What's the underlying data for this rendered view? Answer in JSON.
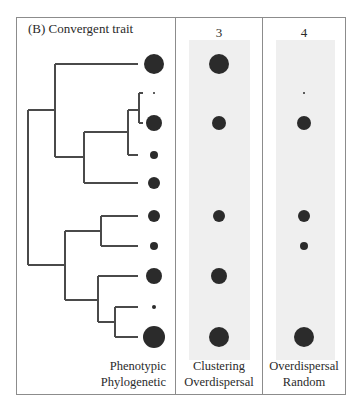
{
  "figure": {
    "panel_label": "(B)  Convergent trait",
    "columns": [
      {
        "id": "phylogeny",
        "label_line1": "Phenotypic",
        "label_line2": "Phylogenetic"
      },
      {
        "id": "3",
        "header": "3",
        "label_line1": "Clustering",
        "label_line2": "Overdispersal"
      },
      {
        "id": "4",
        "header": "4",
        "label_line1": "Overdispersal",
        "label_line2": "Random"
      }
    ],
    "colors": {
      "branch": "#4a4a4a",
      "dot": "#2b2b2b",
      "frame": "#8c8c8c",
      "shade": "#efefef"
    },
    "tips": [
      {
        "index": 1,
        "y": 64,
        "trait_r": 10,
        "col3_r": 10,
        "col4_r": 0
      },
      {
        "index": 2,
        "y": 93,
        "trait_r": 1,
        "col3_r": 0,
        "col4_r": 1
      },
      {
        "index": 3,
        "y": 123,
        "trait_r": 8,
        "col3_r": 7,
        "col4_r": 7
      },
      {
        "index": 4,
        "y": 155,
        "trait_r": 4,
        "col3_r": 0,
        "col4_r": 0
      },
      {
        "index": 5,
        "y": 183,
        "trait_r": 6,
        "col3_r": 0,
        "col4_r": 0
      },
      {
        "index": 6,
        "y": 216,
        "trait_r": 6,
        "col3_r": 6,
        "col4_r": 6
      },
      {
        "index": 7,
        "y": 246,
        "trait_r": 4,
        "col3_r": 0,
        "col4_r": 4
      },
      {
        "index": 8,
        "y": 276,
        "trait_r": 8,
        "col3_r": 8,
        "col4_r": 0
      },
      {
        "index": 9,
        "y": 307,
        "trait_r": 2,
        "col3_r": 0,
        "col4_r": 0
      },
      {
        "index": 10,
        "y": 337,
        "trait_r": 11,
        "col3_r": 10,
        "col4_r": 10
      }
    ]
  }
}
